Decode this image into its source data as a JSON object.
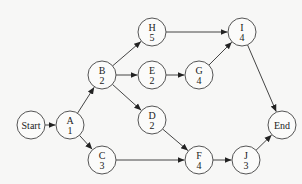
{
  "diagram": {
    "type": "activity-on-node network",
    "nodes": [
      {
        "id": "Start",
        "label": "Start",
        "duration": "",
        "x": 31,
        "y": 125
      },
      {
        "id": "A",
        "label": "A",
        "duration": "1",
        "x": 70,
        "y": 125
      },
      {
        "id": "B",
        "label": "B",
        "duration": "2",
        "x": 102,
        "y": 75
      },
      {
        "id": "C",
        "label": "C",
        "duration": "3",
        "x": 102,
        "y": 160
      },
      {
        "id": "H",
        "label": "H",
        "duration": "5",
        "x": 152,
        "y": 32
      },
      {
        "id": "E",
        "label": "E",
        "duration": "2",
        "x": 152,
        "y": 75
      },
      {
        "id": "D",
        "label": "D",
        "duration": "2",
        "x": 152,
        "y": 120
      },
      {
        "id": "G",
        "label": "G",
        "duration": "4",
        "x": 199,
        "y": 75
      },
      {
        "id": "F",
        "label": "F",
        "duration": "4",
        "x": 199,
        "y": 160
      },
      {
        "id": "I",
        "label": "I",
        "duration": "4",
        "x": 242,
        "y": 32
      },
      {
        "id": "J",
        "label": "J",
        "duration": "3",
        "x": 246,
        "y": 160
      },
      {
        "id": "End",
        "label": "End",
        "duration": "",
        "x": 282,
        "y": 125
      }
    ],
    "edges": [
      [
        "Start",
        "A"
      ],
      [
        "A",
        "B"
      ],
      [
        "A",
        "C"
      ],
      [
        "B",
        "H"
      ],
      [
        "B",
        "E"
      ],
      [
        "B",
        "D"
      ],
      [
        "E",
        "G"
      ],
      [
        "H",
        "I"
      ],
      [
        "G",
        "I"
      ],
      [
        "D",
        "F"
      ],
      [
        "C",
        "F"
      ],
      [
        "F",
        "J"
      ],
      [
        "I",
        "End"
      ],
      [
        "J",
        "End"
      ]
    ],
    "node_radius": 14
  }
}
